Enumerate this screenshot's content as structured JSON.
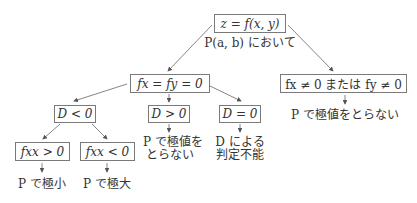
{
  "root": {
    "label": "z = f(x, y)",
    "caption": "P(a, b) において"
  },
  "left_branch": {
    "condition": "fx = fy = 0",
    "children": [
      {
        "condition": "D < 0",
        "children": [
          {
            "condition": "fxx > 0",
            "result": "P で極小"
          },
          {
            "condition": "fxx < 0",
            "result": "P で極大"
          }
        ]
      },
      {
        "condition": "D > 0",
        "result_line1": "P で極値を",
        "result_line2": "とらない"
      },
      {
        "condition": "D = 0",
        "result_line1": "D による",
        "result_line2": "判定不能"
      }
    ]
  },
  "right_branch": {
    "condition": "fx ≠ 0 または fy ≠ 0",
    "result": "P で極値をとらない"
  },
  "colors": {
    "line": "#555555",
    "box_border": "#7a7a7a",
    "text": "#333333"
  }
}
